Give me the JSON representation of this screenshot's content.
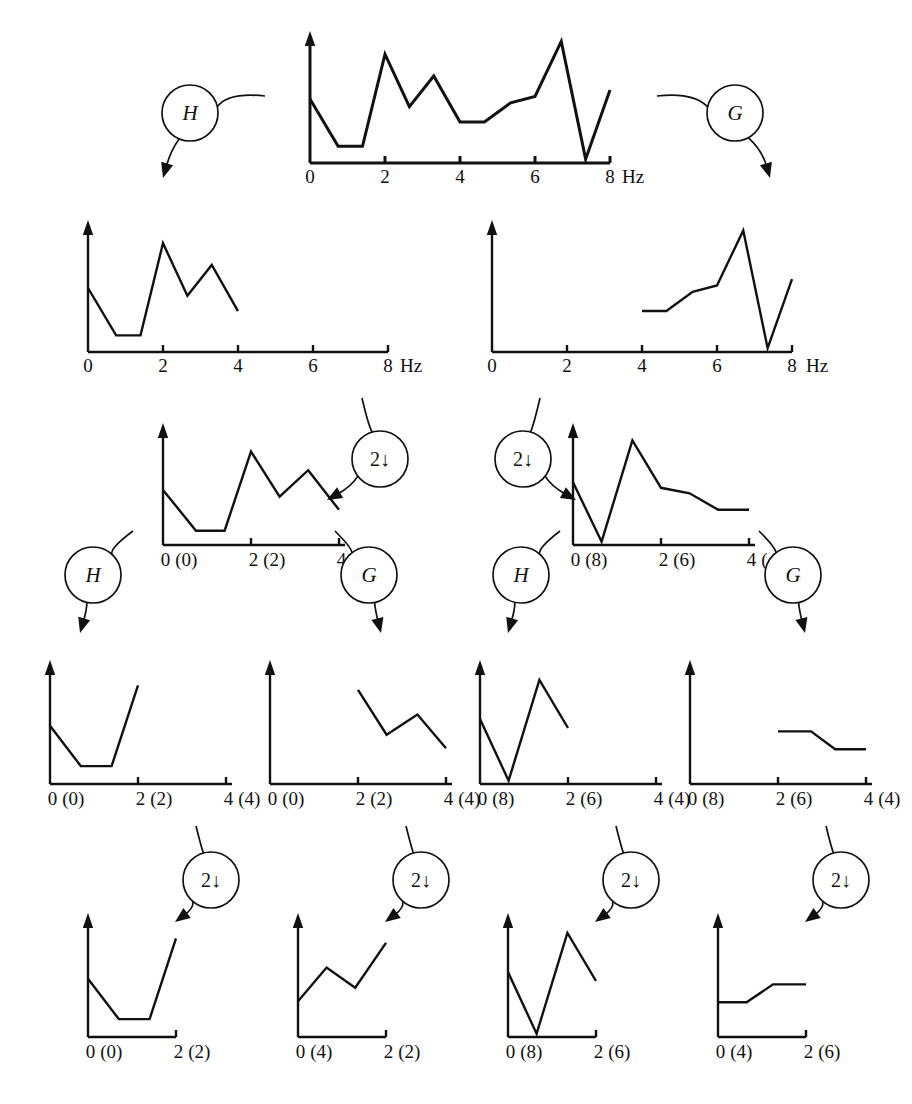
{
  "figure": {
    "stroke_color": "#111111",
    "background": "#ffffff",
    "axis_unit": "Hz",
    "node_labels": {
      "highpass": "H",
      "lowpass": "G",
      "downsample": "2↓"
    }
  },
  "chart_data": [
    {
      "id": "row1-input",
      "type": "line",
      "title": "",
      "xlabel": "Hz",
      "ticks": [
        {
          "value": 0,
          "label": "0"
        },
        {
          "value": 2,
          "label": "2"
        },
        {
          "value": 4,
          "label": "4"
        },
        {
          "value": 6,
          "label": "6"
        },
        {
          "value": 8,
          "label": "8"
        }
      ],
      "xlim": [
        0,
        8
      ],
      "ylim": [
        0,
        1
      ],
      "grid": false,
      "x": [
        0.0,
        0.75,
        1.4,
        2.0,
        2.65,
        3.3,
        4.0,
        4.65,
        5.35,
        6.0,
        6.7,
        7.35,
        8.0
      ],
      "y": [
        0.5,
        0.13,
        0.13,
        0.85,
        0.44,
        0.68,
        0.32,
        0.32,
        0.47,
        0.52,
        0.95,
        0.03,
        0.57
      ]
    },
    {
      "id": "row2-left-H",
      "type": "line",
      "title": "",
      "xlabel": "Hz",
      "ticks": [
        {
          "value": 0,
          "label": "0"
        },
        {
          "value": 2,
          "label": "2"
        },
        {
          "value": 4,
          "label": "4"
        },
        {
          "value": 6,
          "label": "6"
        },
        {
          "value": 8,
          "label": "8"
        }
      ],
      "xlim": [
        0,
        8
      ],
      "ylim": [
        0,
        1
      ],
      "grid": false,
      "x": [
        0.0,
        0.75,
        1.4,
        2.0,
        2.65,
        3.3,
        4.0
      ],
      "y": [
        0.5,
        0.13,
        0.13,
        0.85,
        0.44,
        0.68,
        0.32
      ]
    },
    {
      "id": "row2-right-G",
      "type": "line",
      "title": "",
      "xlabel": "Hz",
      "ticks": [
        {
          "value": 0,
          "label": "0"
        },
        {
          "value": 2,
          "label": "2"
        },
        {
          "value": 4,
          "label": "4"
        },
        {
          "value": 6,
          "label": "6"
        },
        {
          "value": 8,
          "label": "8"
        }
      ],
      "xlim": [
        0,
        8
      ],
      "ylim": [
        0,
        1
      ],
      "grid": false,
      "x": [
        4.0,
        4.65,
        5.35,
        6.0,
        6.7,
        7.35,
        8.0
      ],
      "y": [
        0.32,
        0.32,
        0.47,
        0.52,
        0.95,
        0.03,
        0.57
      ]
    },
    {
      "id": "row3-left",
      "type": "line",
      "title": "",
      "xlabel": "",
      "ticks": [
        {
          "value": 0,
          "label": "0",
          "paren": "(0)"
        },
        {
          "value": 2,
          "label": "2",
          "paren": "(2)"
        },
        {
          "value": 4,
          "label": "4",
          "paren": "(4)"
        }
      ],
      "xlim": [
        0,
        4
      ],
      "ylim": [
        0,
        1
      ],
      "grid": false,
      "x": [
        0.0,
        0.75,
        1.4,
        2.0,
        2.65,
        3.3,
        4.0
      ],
      "y": [
        0.5,
        0.13,
        0.13,
        0.85,
        0.44,
        0.68,
        0.32
      ]
    },
    {
      "id": "row3-right",
      "type": "line",
      "title": "",
      "xlabel": "",
      "ticks": [
        {
          "value": 0,
          "label": "0",
          "paren": "(8)"
        },
        {
          "value": 2,
          "label": "2",
          "paren": "(6)"
        },
        {
          "value": 4,
          "label": "4",
          "paren": "(4)"
        }
      ],
      "xlim": [
        0,
        4
      ],
      "ylim": [
        0,
        1
      ],
      "grid": false,
      "x": [
        0.0,
        0.65,
        1.35,
        2.0,
        2.65,
        3.3,
        4.0
      ],
      "y": [
        0.57,
        0.03,
        0.95,
        0.52,
        0.47,
        0.32,
        0.32
      ]
    },
    {
      "id": "row4-c1",
      "type": "line",
      "title": "",
      "xlabel": "",
      "ticks": [
        {
          "value": 0,
          "label": "0",
          "paren": "(0)"
        },
        {
          "value": 2,
          "label": "2",
          "paren": "(2)"
        },
        {
          "value": 4,
          "label": "4",
          "paren": "(4)"
        }
      ],
      "xlim": [
        0,
        4
      ],
      "ylim": [
        0,
        1
      ],
      "grid": false,
      "x": [
        0.0,
        0.7,
        1.4,
        2.0
      ],
      "y": [
        0.52,
        0.16,
        0.16,
        0.88
      ]
    },
    {
      "id": "row4-c2",
      "type": "line",
      "title": "",
      "xlabel": "",
      "ticks": [
        {
          "value": 0,
          "label": "0",
          "paren": "(0)"
        },
        {
          "value": 2,
          "label": "2",
          "paren": "(2)"
        },
        {
          "value": 4,
          "label": "4",
          "paren": "(4)"
        }
      ],
      "xlim": [
        0,
        4
      ],
      "ylim": [
        0,
        1
      ],
      "grid": false,
      "x": [
        2.0,
        2.65,
        3.35,
        4.0
      ],
      "y": [
        0.84,
        0.44,
        0.62,
        0.32
      ]
    },
    {
      "id": "row4-c3",
      "type": "line",
      "title": "",
      "xlabel": "",
      "ticks": [
        {
          "value": 0,
          "label": "0",
          "paren": "(8)"
        },
        {
          "value": 2,
          "label": "2",
          "paren": "(6)"
        },
        {
          "value": 4,
          "label": "4",
          "paren": "(4)"
        }
      ],
      "xlim": [
        0,
        4
      ],
      "ylim": [
        0,
        1
      ],
      "grid": false,
      "x": [
        0.0,
        0.65,
        1.35,
        2.0
      ],
      "y": [
        0.58,
        0.03,
        0.93,
        0.5
      ]
    },
    {
      "id": "row4-c4",
      "type": "line",
      "title": "",
      "xlabel": "",
      "ticks": [
        {
          "value": 0,
          "label": "0",
          "paren": "(8)"
        },
        {
          "value": 2,
          "label": "2",
          "paren": "(6)"
        },
        {
          "value": 4,
          "label": "4",
          "paren": "(4)"
        }
      ],
      "xlim": [
        0,
        4
      ],
      "ylim": [
        0,
        1
      ],
      "grid": false,
      "x": [
        2.0,
        2.75,
        3.3,
        4.0
      ],
      "y": [
        0.47,
        0.47,
        0.31,
        0.31
      ]
    },
    {
      "id": "row5-c1",
      "type": "line",
      "title": "",
      "xlabel": "",
      "ticks": [
        {
          "value": 0,
          "label": "0",
          "paren": "(0)"
        },
        {
          "value": 2,
          "label": "2",
          "paren": "(2)"
        }
      ],
      "xlim": [
        0,
        2
      ],
      "ylim": [
        0,
        1
      ],
      "grid": false,
      "x": [
        0.0,
        0.7,
        1.4,
        2.0
      ],
      "y": [
        0.52,
        0.16,
        0.16,
        0.88
      ]
    },
    {
      "id": "row5-c2",
      "type": "line",
      "title": "",
      "xlabel": "",
      "ticks": [
        {
          "value": 0,
          "label": "0",
          "paren": "(4)"
        },
        {
          "value": 2,
          "label": "2",
          "paren": "(2)"
        }
      ],
      "xlim": [
        0,
        2
      ],
      "ylim": [
        0,
        1
      ],
      "grid": false,
      "x": [
        0.0,
        0.65,
        1.3,
        2.0
      ],
      "y": [
        0.32,
        0.62,
        0.44,
        0.84
      ]
    },
    {
      "id": "row5-c3",
      "type": "line",
      "title": "",
      "xlabel": "",
      "ticks": [
        {
          "value": 0,
          "label": "0",
          "paren": "(8)"
        },
        {
          "value": 2,
          "label": "2",
          "paren": "(6)"
        }
      ],
      "xlim": [
        0,
        2
      ],
      "ylim": [
        0,
        1
      ],
      "grid": false,
      "x": [
        0.0,
        0.65,
        1.35,
        2.0
      ],
      "y": [
        0.58,
        0.03,
        0.93,
        0.5
      ]
    },
    {
      "id": "row5-c4",
      "type": "line",
      "title": "",
      "xlabel": "",
      "ticks": [
        {
          "value": 0,
          "label": "0",
          "paren": "(4)"
        },
        {
          "value": 2,
          "label": "2",
          "paren": "(6)"
        }
      ],
      "xlim": [
        0,
        2
      ],
      "ylim": [
        0,
        1
      ],
      "grid": false,
      "x": [
        0.0,
        0.65,
        1.25,
        2.0
      ],
      "y": [
        0.31,
        0.31,
        0.47,
        0.47
      ]
    }
  ],
  "nodes": [
    {
      "id": "node-h-1",
      "label": "H",
      "kind": "filter"
    },
    {
      "id": "node-g-1",
      "label": "G",
      "kind": "filter"
    },
    {
      "id": "node-down-1",
      "label": "2↓",
      "kind": "downsample"
    },
    {
      "id": "node-down-2",
      "label": "2↓",
      "kind": "downsample"
    },
    {
      "id": "node-h-2",
      "label": "H",
      "kind": "filter"
    },
    {
      "id": "node-g-2",
      "label": "G",
      "kind": "filter"
    },
    {
      "id": "node-h-3",
      "label": "H",
      "kind": "filter"
    },
    {
      "id": "node-g-3",
      "label": "G",
      "kind": "filter"
    },
    {
      "id": "node-down-3",
      "label": "2↓",
      "kind": "downsample"
    },
    {
      "id": "node-down-4",
      "label": "2↓",
      "kind": "downsample"
    },
    {
      "id": "node-down-5",
      "label": "2↓",
      "kind": "downsample"
    },
    {
      "id": "node-down-6",
      "label": "2↓",
      "kind": "downsample"
    }
  ],
  "axis_units": [
    {
      "id": "unit-row1",
      "text": "Hz"
    },
    {
      "id": "unit-row2-left",
      "text": "Hz"
    },
    {
      "id": "unit-row2-right",
      "text": "Hz"
    }
  ]
}
